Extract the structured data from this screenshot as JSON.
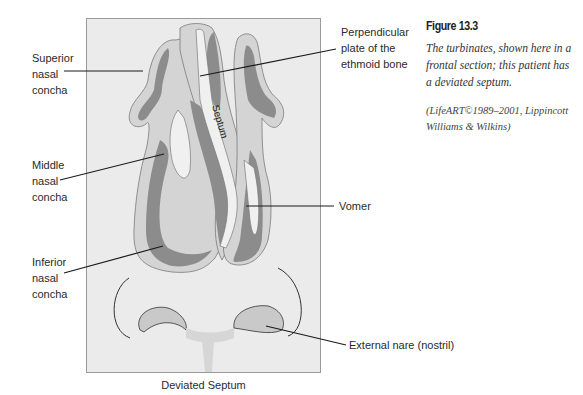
{
  "figure": {
    "title": "Figure 13.3",
    "description": "The turbinates, shown here in a frontal section; this patient has a deviated septum.",
    "credit": "(LifeART©1989–2001, Lippincott Williams & Wilkins)"
  },
  "diagram": {
    "caption": "Deviated Septum",
    "septum_text": "Septum",
    "colors": {
      "panel_bg": "#ebebeb",
      "mucosa": "#d4d4d4",
      "dark_tissue": "#8c8c8c",
      "bone": "#f0f0f0",
      "outline": "#7a7a7a",
      "leader": "#1a1a1a"
    },
    "labels": {
      "superior_nasal_concha": [
        "Superior",
        "nasal",
        "concha"
      ],
      "middle_nasal_concha": [
        "Middle",
        "nasal",
        "concha"
      ],
      "inferior_nasal_concha": [
        "Inferior",
        "nasal",
        "concha"
      ],
      "perpendicular_plate": [
        "Perpendicular",
        "plate of the",
        "ethmoid bone"
      ],
      "vomer": "Vomer",
      "external_nare": "External nare (nostril)"
    }
  }
}
